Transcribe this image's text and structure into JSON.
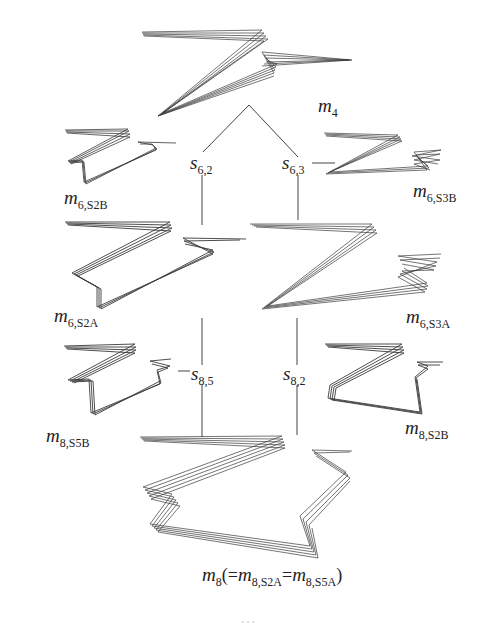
{
  "diagram": {
    "type": "tree of molecular conformation drawings (zigzag wireframes)",
    "stroke_color": "#3a3a3a",
    "line_color": "#444444",
    "nodes": [
      {
        "id": "m4",
        "label": "m",
        "sub": "4"
      },
      {
        "id": "m6_S2B",
        "label": "m",
        "sub": "6,S2B"
      },
      {
        "id": "m6_S3B",
        "label": "m",
        "sub": "6,S3B"
      },
      {
        "id": "m6_S2A",
        "label": "m",
        "sub": "6,S2A"
      },
      {
        "id": "m6_S3A",
        "label": "m",
        "sub": "6,S3A"
      },
      {
        "id": "m8_S5B",
        "label": "m",
        "sub": "8,S5B"
      },
      {
        "id": "m8_S2B",
        "label": "m",
        "sub": "8,S2B"
      },
      {
        "id": "m8",
        "label": "m",
        "sub": "8",
        "extra_open": "(=",
        "extra_m1": "m",
        "extra_sub1": "8,S2A",
        "extra_eq": "=",
        "extra_m2": "m",
        "extra_sub2": "8,S5A",
        "extra_close": ")"
      }
    ],
    "operators": [
      {
        "id": "s6_2",
        "label": "s",
        "sub": "6,2"
      },
      {
        "id": "s6_3",
        "label": "s",
        "sub": "6,3"
      },
      {
        "id": "s8_5",
        "label": "s",
        "sub": "8,5"
      },
      {
        "id": "s8_2",
        "label": "s",
        "sub": "8,2"
      }
    ],
    "edges": [
      [
        "m4",
        "s6_2"
      ],
      [
        "m4",
        "s6_3"
      ],
      [
        "s6_2",
        "m6_S2B"
      ],
      [
        "s6_2",
        "m6_S2A"
      ],
      [
        "s6_3",
        "m6_S3B"
      ],
      [
        "s6_3",
        "m6_S3A"
      ],
      [
        "m6_S2A",
        "s8_5"
      ],
      [
        "s8_5",
        "m8_S5B"
      ],
      [
        "s8_5",
        "m8"
      ],
      [
        "m6_S3A",
        "s8_2"
      ],
      [
        "s8_2",
        "m8_S2B"
      ],
      [
        "s8_2",
        "m8"
      ]
    ]
  },
  "caption": {
    "text": "..."
  }
}
